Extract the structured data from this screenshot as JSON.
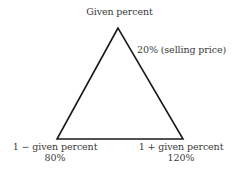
{
  "diagram": {
    "type": "percent-triangle",
    "top_vertex": {
      "label": "Given percent"
    },
    "side_annotation": "20% (selling price)",
    "bottom_left_vertex": {
      "label": "1 − given percent",
      "value": "80%"
    },
    "bottom_right_vertex": {
      "label": "1 + given percent",
      "value": "120%"
    },
    "colors": {
      "stroke": "#1a1a1a",
      "text": "#3a3a3a",
      "background": "#ffffff"
    }
  }
}
